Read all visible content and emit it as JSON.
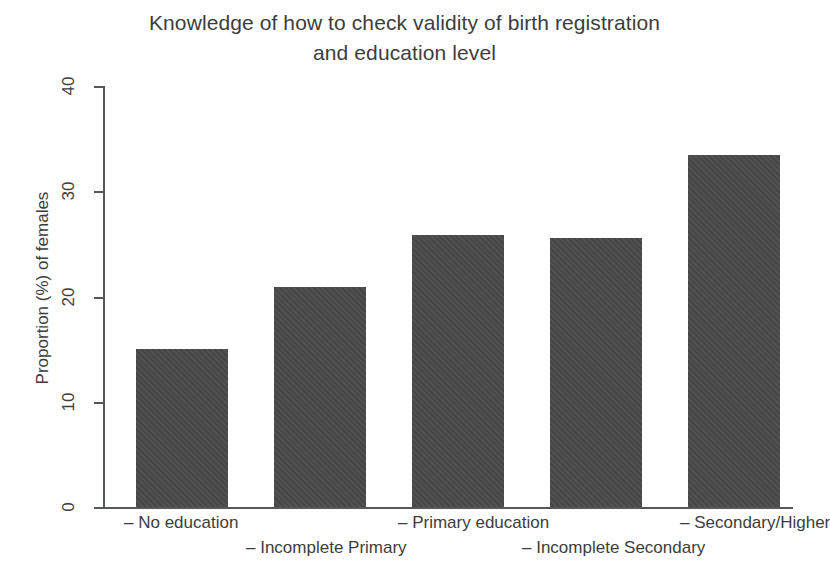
{
  "chart_data": {
    "type": "bar",
    "title": "Knowledge of how to check validity of birth registration and education level",
    "title_line1": "Knowledge of how to check validity of birth registration",
    "title_line2": "and education level",
    "xlabel": "",
    "ylabel": "Proportion (%) of females",
    "ylim": [
      0,
      40
    ],
    "yticks": [
      0,
      10,
      20,
      30,
      40
    ],
    "ytick_labels": [
      "0",
      "10",
      "20",
      "30",
      "40"
    ],
    "grid": false,
    "legend": "none",
    "bar_color": "#4a4a4a",
    "categories": [
      "No education",
      "Incomplete Primary",
      "Primary education",
      "Incomplete Secondary",
      "Secondary/Higher"
    ],
    "category_labels": [
      "– No education",
      "– Incomplete Primary",
      "– Primary education",
      "– Incomplete Secondary",
      "– Secondary/Higher"
    ],
    "values": [
      15.0,
      20.9,
      25.8,
      25.6,
      33.4
    ]
  }
}
